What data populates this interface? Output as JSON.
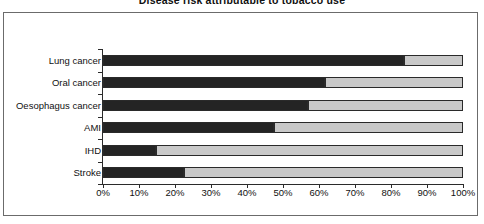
{
  "chart_data": {
    "type": "bar",
    "orientation": "horizontal",
    "stacked": true,
    "normalized_percent": true,
    "title": "Disease risk attributable to tobacco use",
    "xlabel": "",
    "ylabel": "",
    "xlim": [
      0,
      100
    ],
    "grid": false,
    "legend": "none",
    "categories": [
      "Lung cancer",
      "Oral cancer",
      "Oesophagus cancer",
      "AMI",
      "IHD",
      "Stroke"
    ],
    "series": [
      {
        "name": "Attributable to tobacco use",
        "color": "#242424",
        "values": [
          83.5,
          61.6,
          57.0,
          47.6,
          14.8,
          22.5
        ]
      },
      {
        "name": "Not attributable to tobacco use",
        "color": "#c9c9c9",
        "values": [
          16.5,
          38.4,
          43.0,
          52.4,
          85.2,
          77.5
        ]
      }
    ],
    "x_tick_values": [
      0,
      10,
      20,
      30,
      40,
      50,
      60,
      70,
      80,
      90,
      100
    ],
    "x_tick_labels": [
      "0%",
      "10%",
      "20%",
      "30%",
      "40%",
      "50%",
      "60%",
      "70%",
      "80%",
      "90%",
      "100%"
    ]
  },
  "colors": {
    "dark_segment": "#242424",
    "light_segment": "#c9c9c9",
    "axis": "#2b2b2b",
    "frame_border": "#6b6b6b",
    "background": "#ffffff",
    "text": "#111111"
  }
}
